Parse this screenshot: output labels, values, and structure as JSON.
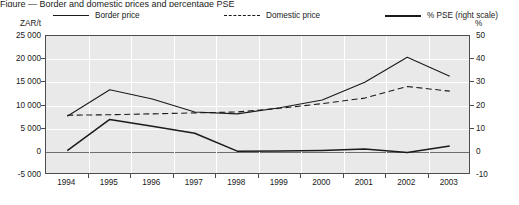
{
  "figure": {
    "title_sliver": "Figure — Border and domestic prices and percentage PSE",
    "axis_left_unit": "ZAR/t",
    "axis_right_unit": "%"
  },
  "legend": {
    "items": [
      {
        "label": "Border price",
        "style": "solid",
        "icon": "line-solid-icon"
      },
      {
        "label": "Domestic price",
        "style": "dashed",
        "icon": "line-dashed-icon"
      },
      {
        "label": "% PSE (right scale)",
        "style": "thick",
        "icon": "line-thick-icon"
      }
    ]
  },
  "chart_data": {
    "type": "line",
    "title": "",
    "xlabel": "",
    "ylabel": "ZAR/t",
    "y2label": "%",
    "categories": [
      "1994",
      "1995",
      "1996",
      "1997",
      "1998",
      "1999",
      "2000",
      "2001",
      "2002",
      "2003"
    ],
    "x": [
      1994,
      1995,
      1996,
      1997,
      1998,
      1999,
      2000,
      2001,
      2002,
      2003
    ],
    "ylim": [
      -5000,
      25000
    ],
    "y2lim": [
      -10,
      50
    ],
    "yticks": [
      "25 000",
      "20 000",
      "15 000",
      "10 000",
      "5 000",
      "0",
      "-5 000"
    ],
    "ytick_values": [
      25000,
      20000,
      15000,
      10000,
      5000,
      0,
      -5000
    ],
    "y2ticks": [
      "50",
      "40",
      "30",
      "20",
      "10",
      "0",
      "-10"
    ],
    "y2tick_values": [
      50,
      40,
      30,
      20,
      10,
      0,
      -10
    ],
    "grid": true,
    "legend_position": "top",
    "series": [
      {
        "name": "Border price",
        "axis": "left",
        "style": "solid",
        "values": [
          7700,
          13400,
          11400,
          8600,
          8200,
          9500,
          11200,
          15000,
          20400,
          16300
        ]
      },
      {
        "name": "Domestic price",
        "axis": "left",
        "style": "dashed",
        "values": [
          7900,
          8000,
          8200,
          8400,
          8600,
          9400,
          10400,
          11600,
          14100,
          13100
        ]
      },
      {
        "name": "% PSE (right scale)",
        "axis": "right",
        "style": "thick",
        "values": [
          0.5,
          14.0,
          11.0,
          8.0,
          0.3,
          0.4,
          0.6,
          1.2,
          -0.3,
          2.5
        ]
      }
    ]
  },
  "colors": {
    "plot_background": "#e9e9e9",
    "line": "#1a1a1a",
    "frame": "#4d4d4d",
    "gridline": "#ffffff",
    "zero_line": "#6f6f6f"
  }
}
